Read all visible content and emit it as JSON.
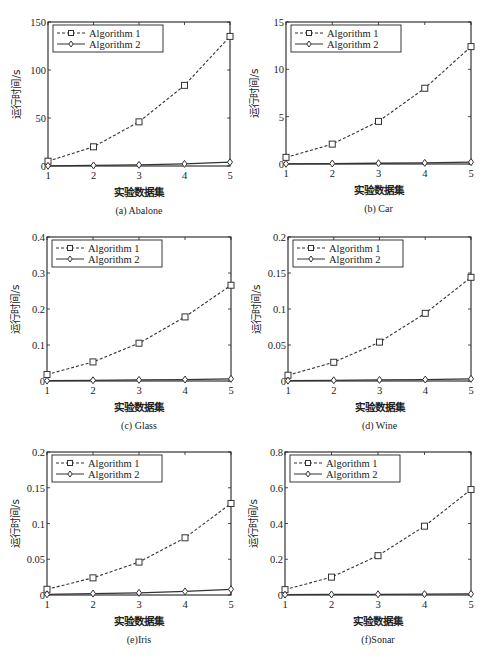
{
  "figure": {
    "xlabel": "实验数据集",
    "ylabel": "运行时间/s",
    "legend": [
      "Algorithm 1",
      "Algorithm 2"
    ],
    "colors": {
      "line": "#333333",
      "frame": "#222222",
      "background": "#ffffff"
    }
  },
  "chart_data": [
    {
      "type": "line",
      "title": "(a) Abalone",
      "xlabel": "实验数据集",
      "ylabel": "运行时间/s",
      "x": [
        1,
        2,
        3,
        4,
        5
      ],
      "xticks": [
        "1",
        "2",
        "3",
        "4",
        "5"
      ],
      "yticks": [
        "0",
        "50",
        "100",
        "150"
      ],
      "ylim": [
        0,
        150
      ],
      "xlim": [
        1,
        5
      ],
      "legend_position": "upper left",
      "grid": false,
      "series": [
        {
          "name": "Algorithm 1",
          "style": "dashed",
          "marker": "square",
          "values": [
            5,
            20,
            46,
            84,
            135
          ]
        },
        {
          "name": "Algorithm 2",
          "style": "solid",
          "marker": "diamond",
          "values": [
            0.2,
            0.6,
            1.2,
            2.2,
            4
          ]
        }
      ]
    },
    {
      "type": "line",
      "title": "(b) Car",
      "xlabel": "实验数据集",
      "ylabel": "运行时间/s",
      "x": [
        1,
        2,
        3,
        4,
        5
      ],
      "xticks": [
        "1",
        "2",
        "3",
        "4",
        "5"
      ],
      "yticks": [
        "0",
        "5",
        "10",
        "15"
      ],
      "ylim": [
        0,
        15
      ],
      "xlim": [
        1,
        5
      ],
      "legend_position": "upper left",
      "grid": false,
      "series": [
        {
          "name": "Algorithm 1",
          "style": "dashed",
          "marker": "square",
          "values": [
            0.7,
            2.1,
            4.5,
            8.0,
            12.4
          ]
        },
        {
          "name": "Algorithm 2",
          "style": "solid",
          "marker": "diamond",
          "values": [
            0.02,
            0.05,
            0.08,
            0.12,
            0.2
          ]
        }
      ]
    },
    {
      "type": "line",
      "title": "(c) Glass",
      "xlabel": "实验数据集",
      "ylabel": "运行时间/s",
      "x": [
        1,
        2,
        3,
        4,
        5
      ],
      "xticks": [
        "1",
        "2",
        "3",
        "4",
        "5"
      ],
      "yticks": [
        "0",
        "0.1",
        "0.2",
        "0.3",
        "0.4"
      ],
      "ylim": [
        0,
        0.4
      ],
      "xlim": [
        1,
        5
      ],
      "legend_position": "upper left",
      "grid": false,
      "series": [
        {
          "name": "Algorithm 1",
          "style": "dashed",
          "marker": "square",
          "values": [
            0.018,
            0.053,
            0.105,
            0.178,
            0.266
          ]
        },
        {
          "name": "Algorithm 2",
          "style": "solid",
          "marker": "diamond",
          "values": [
            0.001,
            0.002,
            0.003,
            0.004,
            0.006
          ]
        }
      ]
    },
    {
      "type": "line",
      "title": "(d) Wine",
      "xlabel": "实验数据集",
      "ylabel": "运行时间/s",
      "x": [
        1,
        2,
        3,
        4,
        5
      ],
      "xticks": [
        "1",
        "2",
        "3",
        "4",
        "5"
      ],
      "yticks": [
        "0",
        "0.05",
        "0.1",
        "0.15",
        "0.2"
      ],
      "ylim": [
        0,
        0.2
      ],
      "xlim": [
        1,
        5
      ],
      "legend_position": "upper left",
      "grid": false,
      "series": [
        {
          "name": "Algorithm 1",
          "style": "dashed",
          "marker": "square",
          "values": [
            0.008,
            0.026,
            0.054,
            0.094,
            0.144
          ]
        },
        {
          "name": "Algorithm 2",
          "style": "solid",
          "marker": "diamond",
          "values": [
            0.0005,
            0.001,
            0.0015,
            0.002,
            0.003
          ]
        }
      ]
    },
    {
      "type": "line",
      "title": "(e)Iris",
      "xlabel": "实验数据集",
      "ylabel": "运行时间/s",
      "x": [
        1,
        2,
        3,
        4,
        5
      ],
      "xticks": [
        "1",
        "2",
        "3",
        "4",
        "5"
      ],
      "yticks": [
        "0",
        "0.05",
        "0.1",
        "0.15",
        "0.2"
      ],
      "ylim": [
        0,
        0.2
      ],
      "xlim": [
        1,
        5
      ],
      "legend_position": "upper left",
      "grid": false,
      "series": [
        {
          "name": "Algorithm 1",
          "style": "dashed",
          "marker": "square",
          "values": [
            0.008,
            0.024,
            0.046,
            0.08,
            0.128
          ]
        },
        {
          "name": "Algorithm 2",
          "style": "solid",
          "marker": "diamond",
          "values": [
            0.001,
            0.002,
            0.003,
            0.005,
            0.008
          ]
        }
      ]
    },
    {
      "type": "line",
      "title": "(f)Sonar",
      "xlabel": "实验数据集",
      "ylabel": "运行时间/s",
      "x": [
        1,
        2,
        3,
        4,
        5
      ],
      "xticks": [
        "1",
        "2",
        "3",
        "4",
        "5"
      ],
      "yticks": [
        "0",
        "0.2",
        "0.4",
        "0.6",
        "0.8"
      ],
      "ylim": [
        0,
        0.8
      ],
      "xlim": [
        1,
        5
      ],
      "legend_position": "upper left",
      "grid": false,
      "series": [
        {
          "name": "Algorithm 1",
          "style": "dashed",
          "marker": "square",
          "values": [
            0.03,
            0.1,
            0.22,
            0.385,
            0.59
          ]
        },
        {
          "name": "Algorithm 2",
          "style": "solid",
          "marker": "diamond",
          "values": [
            0.002,
            0.003,
            0.004,
            0.005,
            0.006
          ]
        }
      ]
    }
  ]
}
